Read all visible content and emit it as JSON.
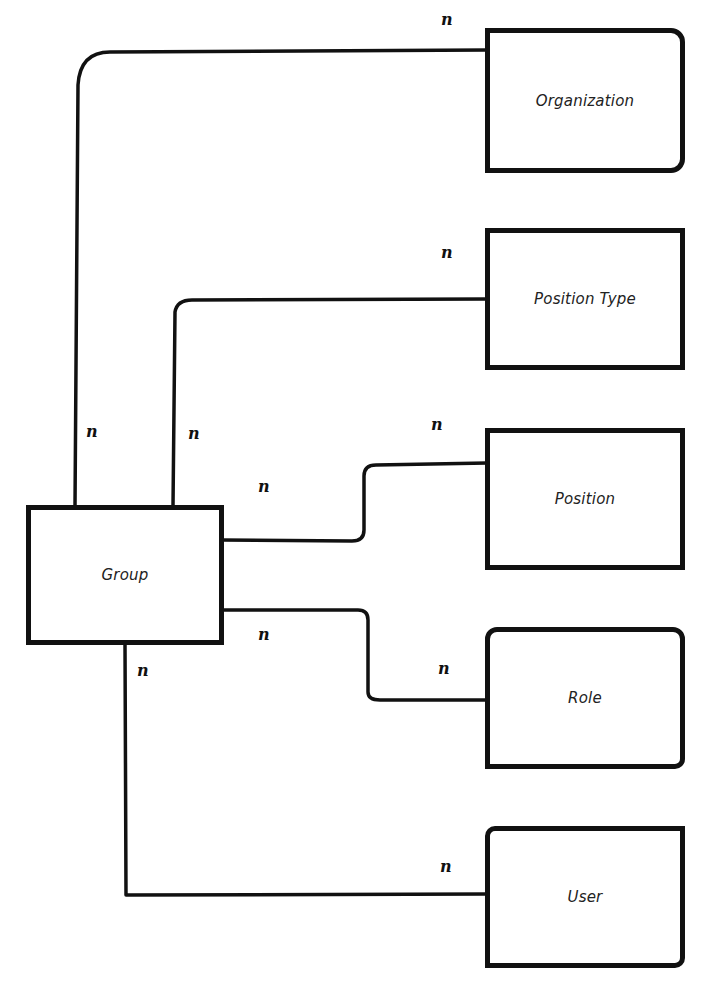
{
  "diagram": {
    "type": "entity-relationship",
    "entities": {
      "organization": {
        "label": "Organization"
      },
      "position_type": {
        "label": "Position Type"
      },
      "position": {
        "label": "Position"
      },
      "role": {
        "label": "Role"
      },
      "user": {
        "label": "User"
      },
      "group": {
        "label": "Group"
      }
    },
    "relationships": [
      {
        "from": "Group",
        "to": "Organization",
        "from_cardinality": "n",
        "to_cardinality": "n"
      },
      {
        "from": "Group",
        "to": "Position Type",
        "from_cardinality": "n",
        "to_cardinality": "n"
      },
      {
        "from": "Group",
        "to": "Position",
        "from_cardinality": "n",
        "to_cardinality": "n"
      },
      {
        "from": "Group",
        "to": "Role",
        "from_cardinality": "n",
        "to_cardinality": "n"
      },
      {
        "from": "Group",
        "to": "User",
        "from_cardinality": "n",
        "to_cardinality": "n"
      }
    ],
    "cardinality_labels": {
      "org_end": "n",
      "org_group_end": "n",
      "ptype_end": "n",
      "ptype_group_end": "n",
      "position_end": "n",
      "position_group_end": "n",
      "role_end": "n",
      "role_group_end": "n",
      "user_end": "n",
      "user_group_end": "n"
    },
    "colors": {
      "stroke": "#111111",
      "background": "#ffffff"
    }
  }
}
